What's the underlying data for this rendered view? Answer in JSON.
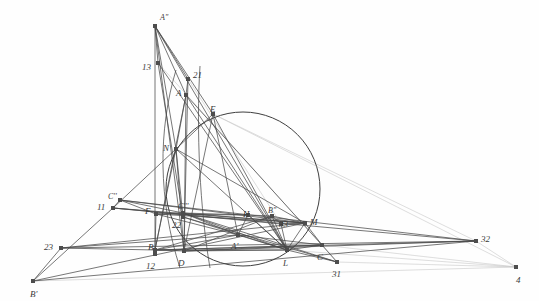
{
  "figure": {
    "width": 539,
    "height": 301,
    "background_color": "#fefefe",
    "stroke_color": "#4a4a4a",
    "faint_stroke_color": "#c8c8c8",
    "node_color": "#4d4d4d",
    "label_color": "#3a3a3a"
  },
  "circle": {
    "name": "main-circle",
    "cx": 243,
    "cy": 189,
    "r": 77,
    "stroke": "#3f3f3f"
  },
  "points": [
    {
      "id": "A2",
      "label": "A''",
      "x": 155,
      "y": 26,
      "lx": 160,
      "ly": 14,
      "marker": "square"
    },
    {
      "id": "n13",
      "label": "13",
      "x": 158,
      "y": 63,
      "lx": 142,
      "ly": 63,
      "marker": "square"
    },
    {
      "id": "n21",
      "label": "21",
      "x": 188,
      "y": 79,
      "lx": 193,
      "ly": 71,
      "marker": "square"
    },
    {
      "id": "A",
      "label": "A",
      "x": 186,
      "y": 95,
      "lx": 176,
      "ly": 89,
      "marker": "square"
    },
    {
      "id": "E",
      "label": "E",
      "x": 213,
      "y": 114,
      "lx": 210,
      "ly": 105,
      "marker": "square"
    },
    {
      "id": "N",
      "label": "N",
      "x": 176,
      "y": 149,
      "lx": 163,
      "ly": 144,
      "marker": "square"
    },
    {
      "id": "C2",
      "label": "C''",
      "x": 120,
      "y": 200,
      "lx": 108,
      "ly": 193,
      "marker": "square"
    },
    {
      "id": "n11",
      "label": "11",
      "x": 113,
      "y": 208,
      "lx": 97,
      "ly": 203,
      "marker": "square"
    },
    {
      "id": "F",
      "label": "F",
      "x": 156,
      "y": 214,
      "lx": 145,
      "ly": 207,
      "marker": "square"
    },
    {
      "id": "C3",
      "label": "C'''",
      "x": 183,
      "y": 213,
      "lx": 178,
      "ly": 203,
      "marker": "square"
    },
    {
      "id": "n22",
      "label": "22",
      "x": 183,
      "y": 217,
      "lx": 172,
      "ly": 221,
      "marker": "square"
    },
    {
      "id": "H",
      "label": "H",
      "x": 248,
      "y": 215,
      "lx": 243,
      "ly": 210,
      "marker": "square"
    },
    {
      "id": "B2",
      "label": "B''",
      "x": 272,
      "y": 216,
      "lx": 268,
      "ly": 207,
      "marker": "square"
    },
    {
      "id": "n33",
      "label": "33",
      "x": 281,
      "y": 224,
      "lx": 279,
      "ly": 220,
      "marker": "square"
    },
    {
      "id": "M",
      "label": "M",
      "x": 305,
      "y": 223,
      "lx": 310,
      "ly": 218,
      "marker": "square"
    },
    {
      "id": "A1",
      "label": "A'",
      "x": 238,
      "y": 235,
      "lx": 231,
      "ly": 242,
      "marker": "square"
    },
    {
      "id": "B",
      "label": "B",
      "x": 155,
      "y": 250,
      "lx": 148,
      "ly": 243,
      "marker": "square"
    },
    {
      "id": "n12",
      "label": "12",
      "x": 155,
      "y": 254,
      "lx": 146,
      "ly": 262,
      "marker": "square"
    },
    {
      "id": "D",
      "label": "D",
      "x": 184,
      "y": 251,
      "lx": 178,
      "ly": 259,
      "marker": "square"
    },
    {
      "id": "L",
      "label": "L",
      "x": 287,
      "y": 250,
      "lx": 283,
      "ly": 259,
      "marker": "square"
    },
    {
      "id": "C",
      "label": "C",
      "x": 322,
      "y": 245,
      "lx": 317,
      "ly": 253,
      "marker": "square"
    },
    {
      "id": "n31",
      "label": "31",
      "x": 337,
      "y": 262,
      "lx": 332,
      "ly": 270,
      "marker": "square"
    },
    {
      "id": "n23",
      "label": "23",
      "x": 61,
      "y": 248,
      "lx": 44,
      "ly": 243,
      "marker": "square"
    },
    {
      "id": "B1",
      "label": "B'",
      "x": 33,
      "y": 281,
      "lx": 30,
      "ly": 290,
      "marker": "square"
    },
    {
      "id": "n32",
      "label": "32",
      "x": 476,
      "y": 241,
      "lx": 481,
      "ly": 235,
      "marker": "square"
    },
    {
      "id": "n4",
      "label": "4",
      "x": 516,
      "y": 267,
      "lx": 516,
      "ly": 276,
      "marker": "square"
    }
  ],
  "segments": [
    {
      "from": "A2",
      "to": "N",
      "weight": "strong"
    },
    {
      "from": "A2",
      "to": "B",
      "weight": "strong"
    },
    {
      "from": "A2",
      "to": "D",
      "weight": "strong"
    },
    {
      "from": "A2",
      "to": "n21",
      "weight": "strong"
    },
    {
      "from": "A2",
      "to": "A",
      "weight": "strong"
    },
    {
      "from": "A2",
      "to": "E",
      "weight": "strong"
    },
    {
      "from": "A2",
      "to": "L",
      "weight": "strong"
    },
    {
      "from": "A2",
      "to": "n13",
      "weight": "strong"
    },
    {
      "from": "n13",
      "to": "L",
      "weight": "strong"
    },
    {
      "from": "n13",
      "to": "n22",
      "weight": "strong"
    },
    {
      "from": "n21",
      "to": "A",
      "weight": "strong"
    },
    {
      "from": "n21",
      "to": "D",
      "weight": "strong"
    },
    {
      "from": "n21",
      "to": "n33",
      "weight": "faint"
    },
    {
      "from": "A",
      "to": "N",
      "weight": "strong"
    },
    {
      "from": "A",
      "to": "D",
      "weight": "strong"
    },
    {
      "from": "A",
      "to": "L",
      "weight": "strong"
    },
    {
      "from": "A",
      "to": "B",
      "weight": "strong"
    },
    {
      "from": "A",
      "to": "C",
      "weight": "strong"
    },
    {
      "from": "E",
      "to": "N",
      "weight": "strong"
    },
    {
      "from": "E",
      "to": "A1",
      "weight": "strong"
    },
    {
      "from": "E",
      "to": "L",
      "weight": "strong"
    },
    {
      "from": "E",
      "to": "D",
      "weight": "strong"
    },
    {
      "from": "E",
      "to": "n32",
      "weight": "faint"
    },
    {
      "from": "E",
      "to": "n4",
      "weight": "faint"
    },
    {
      "from": "N",
      "to": "n11",
      "weight": "strong"
    },
    {
      "from": "N",
      "to": "D",
      "weight": "strong"
    },
    {
      "from": "N",
      "to": "B",
      "weight": "strong"
    },
    {
      "from": "N",
      "to": "L",
      "weight": "strong"
    },
    {
      "from": "N",
      "to": "M",
      "weight": "strong"
    },
    {
      "from": "N",
      "to": "n22",
      "weight": "strong"
    },
    {
      "from": "C2",
      "to": "n11",
      "weight": "strong"
    },
    {
      "from": "C2",
      "to": "F",
      "weight": "strong"
    },
    {
      "from": "C2",
      "to": "C3",
      "weight": "strong"
    },
    {
      "from": "C2",
      "to": "M",
      "weight": "strong"
    },
    {
      "from": "C2",
      "to": "n32",
      "weight": "strong"
    },
    {
      "from": "n11",
      "to": "B1",
      "weight": "strong"
    },
    {
      "from": "n11",
      "to": "n33",
      "weight": "strong"
    },
    {
      "from": "n11",
      "to": "M",
      "weight": "strong"
    },
    {
      "from": "n11",
      "to": "n32",
      "weight": "strong"
    },
    {
      "from": "F",
      "to": "C3",
      "weight": "strong"
    },
    {
      "from": "F",
      "to": "H",
      "weight": "strong"
    },
    {
      "from": "F",
      "to": "M",
      "weight": "strong"
    },
    {
      "from": "F",
      "to": "B",
      "weight": "strong"
    },
    {
      "from": "F",
      "to": "A1",
      "weight": "strong"
    },
    {
      "from": "C3",
      "to": "H",
      "weight": "strong"
    },
    {
      "from": "C3",
      "to": "A1",
      "weight": "strong"
    },
    {
      "from": "C3",
      "to": "L",
      "weight": "strong"
    },
    {
      "from": "C3",
      "to": "M",
      "weight": "strong"
    },
    {
      "from": "C3",
      "to": "n31",
      "weight": "strong"
    },
    {
      "from": "n22",
      "to": "L",
      "weight": "strong"
    },
    {
      "from": "n22",
      "to": "n31",
      "weight": "strong"
    },
    {
      "from": "H",
      "to": "B2",
      "weight": "strong"
    },
    {
      "from": "H",
      "to": "L",
      "weight": "strong"
    },
    {
      "from": "H",
      "to": "A1",
      "weight": "strong"
    },
    {
      "from": "B2",
      "to": "M",
      "weight": "strong"
    },
    {
      "from": "B2",
      "to": "n33",
      "weight": "strong"
    },
    {
      "from": "B2",
      "to": "L",
      "weight": "strong"
    },
    {
      "from": "B2",
      "to": "D",
      "weight": "strong"
    },
    {
      "from": "B2",
      "to": "B",
      "weight": "strong"
    },
    {
      "from": "n33",
      "to": "L",
      "weight": "strong"
    },
    {
      "from": "n33",
      "to": "M",
      "weight": "strong"
    },
    {
      "from": "M",
      "to": "L",
      "weight": "strong"
    },
    {
      "from": "M",
      "to": "C",
      "weight": "strong"
    },
    {
      "from": "M",
      "to": "n23",
      "weight": "strong"
    },
    {
      "from": "M",
      "to": "B1",
      "weight": "strong"
    },
    {
      "from": "A1",
      "to": "B",
      "weight": "strong"
    },
    {
      "from": "A1",
      "to": "L",
      "weight": "strong"
    },
    {
      "from": "A1",
      "to": "C",
      "weight": "strong"
    },
    {
      "from": "A1",
      "to": "n23",
      "weight": "strong"
    },
    {
      "from": "B",
      "to": "D",
      "weight": "strong"
    },
    {
      "from": "B",
      "to": "L",
      "weight": "strong"
    },
    {
      "from": "B",
      "to": "C",
      "weight": "strong"
    },
    {
      "from": "B",
      "to": "n23",
      "weight": "strong"
    },
    {
      "from": "B",
      "to": "n32",
      "weight": "strong"
    },
    {
      "from": "D",
      "to": "L",
      "weight": "strong"
    },
    {
      "from": "D",
      "to": "C",
      "weight": "strong"
    },
    {
      "from": "D",
      "to": "n32",
      "weight": "strong"
    },
    {
      "from": "L",
      "to": "C",
      "weight": "strong"
    },
    {
      "from": "L",
      "to": "n31",
      "weight": "strong"
    },
    {
      "from": "L",
      "to": "n4",
      "weight": "faint"
    },
    {
      "from": "C",
      "to": "n31",
      "weight": "strong"
    },
    {
      "from": "C",
      "to": "n4",
      "weight": "faint"
    },
    {
      "from": "n23",
      "to": "B1",
      "weight": "strong"
    },
    {
      "from": "n23",
      "to": "n32",
      "weight": "strong"
    },
    {
      "from": "B1",
      "to": "n32",
      "weight": "strong"
    },
    {
      "from": "B1",
      "to": "n4",
      "weight": "faint"
    },
    {
      "from": "n32",
      "to": "n4",
      "weight": "faint"
    },
    {
      "from": "n31",
      "to": "n4",
      "weight": "faint"
    },
    {
      "from": "n13",
      "to": "n31",
      "weight": "faint"
    }
  ],
  "arcs": [
    {
      "id": "arc-left",
      "d": "M 176 70 C 158 130 158 200 180 268",
      "weight": "strong"
    },
    {
      "id": "arc-right",
      "d": "M 200 66 C 196 130 200 210 210 268",
      "weight": "strong"
    }
  ]
}
